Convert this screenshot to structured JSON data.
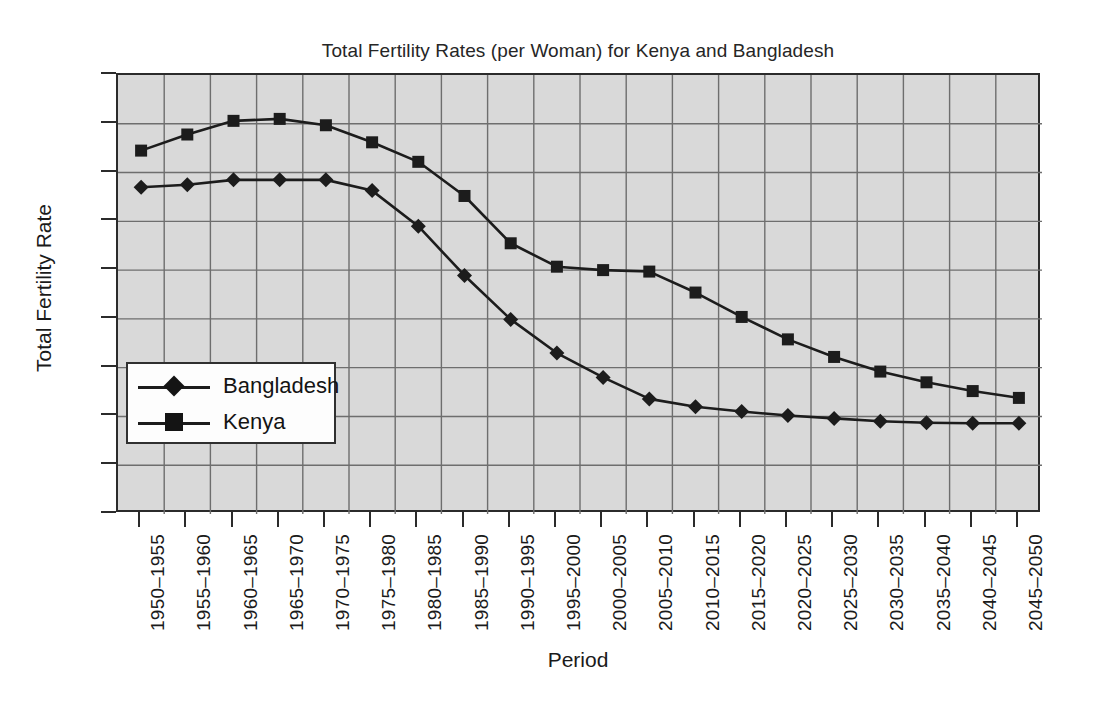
{
  "chart_data": {
    "type": "line",
    "title": "Total Fertility Rates (per Woman) for Kenya and Bangladesh",
    "xlabel": "Period",
    "ylabel": "Total Fertility Rate",
    "ylim": [
      0,
      9
    ],
    "yticks": [
      0,
      1,
      2,
      3,
      4,
      5,
      6,
      7,
      8,
      9
    ],
    "grid": true,
    "legend_position": "inside-lower-left",
    "categories": [
      "1950–1955",
      "1955–1960",
      "1960–1965",
      "1965–1970",
      "1970–1975",
      "1975–1980",
      "1980–1985",
      "1985–1990",
      "1990–1995",
      "1995–2000",
      "2000–2005",
      "2005–2010",
      "2010–2015",
      "2015–2020",
      "2020–2025",
      "2025–2030",
      "2030–2035",
      "2035–2040",
      "2040–2045",
      "2045–2050"
    ],
    "series": [
      {
        "name": "Bangladesh",
        "marker": "diamond",
        "values": [
          6.7,
          6.75,
          6.85,
          6.85,
          6.85,
          6.63,
          5.9,
          4.89,
          3.99,
          3.3,
          2.8,
          2.36,
          2.2,
          2.1,
          2.02,
          1.96,
          1.9,
          1.87,
          1.86,
          1.86
        ]
      },
      {
        "name": "Kenya",
        "marker": "square",
        "values": [
          7.45,
          7.78,
          8.06,
          8.1,
          7.97,
          7.62,
          7.22,
          6.52,
          5.55,
          5.07,
          5.0,
          4.97,
          4.54,
          4.04,
          3.58,
          3.22,
          2.92,
          2.7,
          2.52,
          2.38
        ]
      }
    ]
  },
  "colors": {
    "plot_background": "#d9d9d9",
    "gridline": "#6e6e6e",
    "axis": "#2b2b2b",
    "series_line": "#1c1c1c",
    "page_background": "#ffffff"
  }
}
